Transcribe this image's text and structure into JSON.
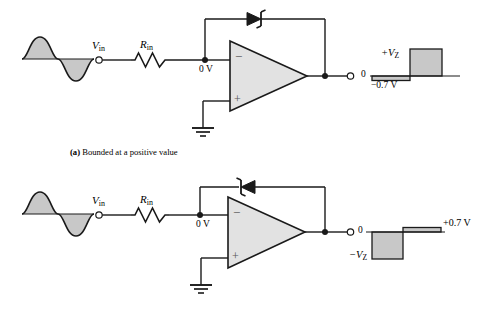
{
  "figure": {
    "type": "circuit-diagram",
    "panels": [
      {
        "id": "panel-a",
        "caption_prefix": "(a)",
        "caption_text": "Bounded at a positive value",
        "input_source_label": "V",
        "input_source_sub": "in",
        "resistor_label": "R",
        "resistor_sub": "in",
        "node_label": "0 V",
        "opamp_minus": "−",
        "opamp_plus": "+",
        "diode_name": "zener-diode",
        "diode_direction": "right",
        "output_zero_label": "0",
        "output_upper_label": "+V",
        "output_upper_sub": "Z",
        "output_lower_label": "−0.7 V",
        "waveform_in": "sine",
        "waveform_out": "bounded-positive"
      },
      {
        "id": "panel-b",
        "caption_prefix": "",
        "caption_text": "",
        "input_source_label": "V",
        "input_source_sub": "in",
        "resistor_label": "R",
        "resistor_sub": "in",
        "node_label": "0 V",
        "opamp_minus": "−",
        "opamp_plus": "+",
        "diode_name": "zener-diode",
        "diode_direction": "left",
        "output_zero_label": "0",
        "output_upper_label": "+0.7 V",
        "output_lower_label": "−V",
        "output_lower_sub": "Z",
        "waveform_in": "sine",
        "waveform_out": "bounded-negative"
      }
    ]
  },
  "colors": {
    "line": "#1a1a1a",
    "fill_gray": "#c8c8c8",
    "opamp_fill": "#e2e2e2",
    "background": "#ffffff"
  }
}
